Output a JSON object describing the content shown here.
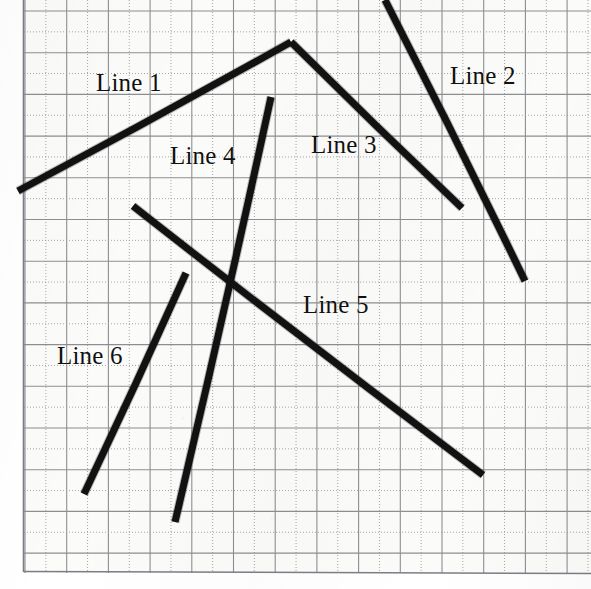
{
  "figure": {
    "width": 591,
    "height": 589,
    "background_color": "#fbfbf9",
    "stroke_color": "#121212",
    "grid": {
      "solid_color": "#8c8f92",
      "dotted_color": "#9a9ca0",
      "border_color": "#7b7e82",
      "major_spacing": 41.7,
      "minor_dotted": true,
      "x_origin": 25,
      "y_origin": 11,
      "columns": 13,
      "rows": 13
    },
    "labels": [
      {
        "id": "label-line-1",
        "text": "Line 1",
        "x": 96,
        "y": 70
      },
      {
        "id": "label-line-2",
        "text": "Line 2",
        "x": 450,
        "y": 63
      },
      {
        "id": "label-line-3",
        "text": "Line 3",
        "x": 311,
        "y": 132
      },
      {
        "id": "label-line-4",
        "text": "Line 4",
        "x": 170,
        "y": 143
      },
      {
        "id": "label-line-5",
        "text": "Line 5",
        "x": 303,
        "y": 292
      },
      {
        "id": "label-line-6",
        "text": "Line 6",
        "x": 57,
        "y": 343
      }
    ],
    "lines": [
      {
        "id": "line-1",
        "name": "Line 1",
        "x1": 18,
        "y1": 191,
        "x2": 291,
        "y2": 42,
        "width": 7
      },
      {
        "id": "line-2",
        "name": "Line 2",
        "x1": 385,
        "y1": 0,
        "x2": 525,
        "y2": 281,
        "width": 7
      },
      {
        "id": "line-3",
        "name": "Line 3",
        "x1": 291,
        "y1": 42,
        "x2": 462,
        "y2": 208,
        "width": 7
      },
      {
        "id": "line-4",
        "name": "Line 4",
        "x1": 271,
        "y1": 97,
        "x2": 175,
        "y2": 522,
        "width": 7
      },
      {
        "id": "line-5",
        "name": "Line 5",
        "x1": 133,
        "y1": 206,
        "x2": 483,
        "y2": 475,
        "width": 7
      },
      {
        "id": "line-6",
        "name": "Line 6",
        "x1": 186,
        "y1": 273,
        "x2": 84,
        "y2": 494,
        "width": 7
      }
    ]
  },
  "chart_data": {
    "type": "line",
    "xlabel": "",
    "ylabel": "",
    "xlim": [
      0,
      591
    ],
    "ylim": [
      589,
      0
    ],
    "grid": true,
    "legend": "inline-annotations",
    "series": [
      {
        "name": "Line 1",
        "x": [
          18,
          291
        ],
        "y": [
          191,
          42
        ]
      },
      {
        "name": "Line 2",
        "x": [
          385,
          525
        ],
        "y": [
          0,
          281
        ]
      },
      {
        "name": "Line 3",
        "x": [
          291,
          462
        ],
        "y": [
          42,
          208
        ]
      },
      {
        "name": "Line 4",
        "x": [
          271,
          175
        ],
        "y": [
          97,
          522
        ]
      },
      {
        "name": "Line 5",
        "x": [
          133,
          483
        ],
        "y": [
          206,
          475
        ]
      },
      {
        "name": "Line 6",
        "x": [
          186,
          84
        ],
        "y": [
          273,
          494
        ]
      }
    ],
    "annotations": [
      "Line 1",
      "Line 2",
      "Line 3",
      "Line 4",
      "Line 5",
      "Line 6"
    ]
  }
}
